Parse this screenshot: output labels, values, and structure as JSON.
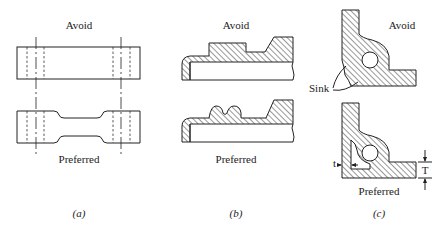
{
  "figure": {
    "panels": [
      {
        "id": "a",
        "caption": "(a)",
        "top_label": "Avoid",
        "bottom_label": "Preferred",
        "description": "Flat plate with uniform section vs. plate with relieved center section; centerlines and hidden (dashed) hole lines at both ends"
      },
      {
        "id": "b",
        "caption": "(b)",
        "top_label": "Avoid",
        "bottom_label": "Preferred",
        "description": "Section with rectangular boss (avoid) vs. rounded ribs (preferred), hatched cross-section"
      },
      {
        "id": "c",
        "caption": "(c)",
        "top_label": "Avoid",
        "bottom_label": "Preferred",
        "annotation_sink": "Sink",
        "annotation_t": "t",
        "annotation_T": "T",
        "description": "L-shaped corner with hole: thick junction causes sink (avoid) vs. cored-out corner with wall thickness t and T (preferred)"
      }
    ]
  }
}
